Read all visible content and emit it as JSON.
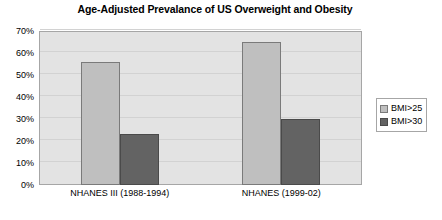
{
  "chart_data": {
    "type": "bar",
    "title": "Age-Adjusted Prevalance of US Overweight and Obesity",
    "xlabel": "",
    "ylabel": "",
    "categories": [
      "NHANES III (1988-1994)",
      "NHANES (1999-02)"
    ],
    "series": [
      {
        "name": "BMI>25",
        "values": [
          56,
          65
        ],
        "color": "#bfbfbf"
      },
      {
        "name": "BMI>30",
        "values": [
          23,
          30
        ],
        "color": "#636363"
      }
    ],
    "ylim": [
      0,
      70
    ],
    "ytick_values": [
      0,
      10,
      20,
      30,
      40,
      50,
      60,
      70
    ],
    "ytick_labels": [
      "0%",
      "10%",
      "20%",
      "30%",
      "40%",
      "50%",
      "60%",
      "70%"
    ],
    "value_format": "percent",
    "grid": true,
    "grid_axis": "y",
    "legend_position": "right",
    "plot_background": "#e3e3e3",
    "figure_background": "#ffffff"
  }
}
